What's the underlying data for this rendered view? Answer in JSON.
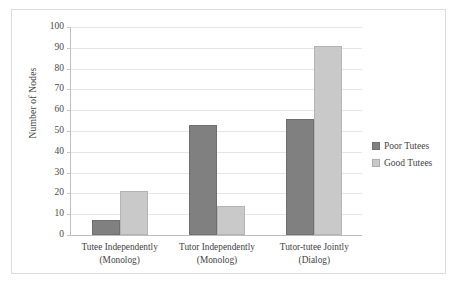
{
  "chart_data": {
    "type": "bar",
    "title": "",
    "subtitle": "",
    "xlabel": "",
    "ylabel": "Number of Nodes",
    "categories": [
      "Tutee Independently (Monolog)",
      "Tutor Independently (Monolog)",
      "Tutor-tutee Jointly (Dialog)"
    ],
    "category_lines": [
      [
        "Tutee Independently",
        "(Monolog)"
      ],
      [
        "Tutor Independently",
        "(Monolog)"
      ],
      [
        "Tutor-tutee Jointly",
        "(Dialog)"
      ]
    ],
    "series": [
      {
        "name": "Poor Tutees",
        "values": [
          7,
          53,
          56
        ],
        "color": "#808080"
      },
      {
        "name": "Good Tutees",
        "values": [
          21,
          14,
          91
        ],
        "color": "#c9c9c9"
      }
    ],
    "ylim": [
      0,
      100
    ],
    "ytick_step": 10,
    "yticks": [
      100,
      90,
      80,
      70,
      60,
      50,
      40,
      30,
      20,
      10,
      0
    ],
    "grid": "horizontal",
    "legend_position": "right",
    "grouping": "grouped"
  }
}
